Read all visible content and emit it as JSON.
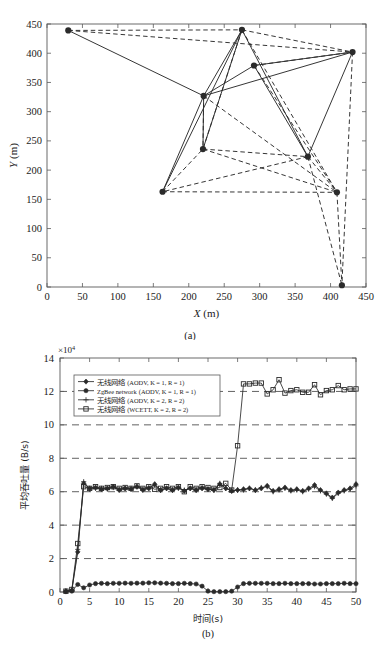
{
  "figure": {
    "panels": [
      {
        "id": "a",
        "caption": "(a)",
        "xlabel_var": "X",
        "xlabel_unit": "(m)",
        "ylabel_var": "Y",
        "ylabel_unit": "(m)"
      },
      {
        "id": "b",
        "caption": "(b)",
        "xlabel": "时间(s)",
        "ylabel": "平均吞吐量 (B/s)",
        "exponent_prefix": "×10",
        "exponent_power": "4"
      }
    ]
  },
  "chart_data": [
    {
      "type": "scatter",
      "title": "",
      "xlabel": "X (m)",
      "ylabel": "Y (m)",
      "xlim": [
        0,
        450
      ],
      "ylim": [
        0,
        450
      ],
      "xticks": [
        0,
        50,
        100,
        150,
        200,
        250,
        300,
        350,
        400,
        450
      ],
      "yticks": [
        0,
        50,
        100,
        150,
        200,
        250,
        300,
        350,
        400,
        450
      ],
      "grid": false,
      "legend": "none",
      "annotations": [
        "Wireless mesh network node topology; solid lines = selected routing links, dashed lines = candidate links"
      ],
      "nodes": [
        {
          "id": 0,
          "x": 30,
          "y": 439
        },
        {
          "id": 1,
          "x": 275,
          "y": 440
        },
        {
          "id": 2,
          "x": 292,
          "y": 379
        },
        {
          "id": 3,
          "x": 431,
          "y": 402
        },
        {
          "id": 4,
          "x": 221,
          "y": 327
        },
        {
          "id": 5,
          "x": 220,
          "y": 236
        },
        {
          "id": 6,
          "x": 368,
          "y": 223
        },
        {
          "id": 7,
          "x": 163,
          "y": 163
        },
        {
          "id": 8,
          "x": 409,
          "y": 162
        },
        {
          "id": 9,
          "x": 416,
          "y": 3
        }
      ],
      "solid_edges": [
        [
          0,
          4
        ],
        [
          1,
          4
        ],
        [
          1,
          7
        ],
        [
          1,
          6
        ],
        [
          2,
          4
        ],
        [
          2,
          6
        ],
        [
          3,
          4
        ],
        [
          3,
          2
        ],
        [
          3,
          6
        ],
        [
          4,
          7
        ],
        [
          4,
          5
        ],
        [
          5,
          1
        ]
      ],
      "dashed_edges": [
        [
          0,
          1
        ],
        [
          0,
          3
        ],
        [
          1,
          3
        ],
        [
          1,
          5
        ],
        [
          1,
          8
        ],
        [
          2,
          3
        ],
        [
          2,
          8
        ],
        [
          3,
          9
        ],
        [
          4,
          5
        ],
        [
          4,
          8
        ],
        [
          5,
          6
        ],
        [
          5,
          8
        ],
        [
          6,
          7
        ],
        [
          6,
          8
        ],
        [
          6,
          9
        ],
        [
          7,
          5
        ],
        [
          7,
          8
        ],
        [
          8,
          9
        ]
      ]
    },
    {
      "type": "line",
      "title": "",
      "xlabel": "时间(s)",
      "ylabel": "平均吞吐量 (B/s)",
      "y_exponent": 10000,
      "xlim": [
        0,
        50
      ],
      "ylim": [
        0,
        14
      ],
      "xticks": [
        0,
        5,
        10,
        15,
        20,
        25,
        30,
        35,
        40,
        45,
        50
      ],
      "yticks": [
        0,
        2,
        4,
        6,
        8,
        10,
        12,
        14
      ],
      "grid": true,
      "grid_style": "dashed-horizontal",
      "legend_position": "upper-left",
      "x": [
        1,
        2,
        3,
        4,
        5,
        6,
        7,
        8,
        9,
        10,
        11,
        12,
        13,
        14,
        15,
        16,
        17,
        18,
        19,
        20,
        21,
        22,
        23,
        24,
        25,
        26,
        27,
        28,
        29,
        30,
        31,
        32,
        33,
        34,
        35,
        36,
        37,
        38,
        39,
        40,
        41,
        42,
        43,
        44,
        45,
        46,
        47,
        48,
        49,
        50
      ],
      "series": [
        {
          "name": "无线网络 (AODV, K = 1, R = 1)",
          "marker": "diamond",
          "values": [
            0.05,
            0.1,
            2.4,
            6.5,
            6.2,
            6.25,
            6.15,
            6.2,
            6.3,
            6.1,
            6.2,
            6.15,
            6.3,
            6.1,
            6.2,
            6.45,
            6.1,
            6.2,
            6.1,
            6.25,
            6.05,
            6.2,
            6.1,
            6.2,
            6.15,
            6.1,
            6.45,
            6.2,
            6.05,
            6.1,
            6.15,
            6.2,
            6.1,
            6.2,
            6.35,
            6.05,
            6.15,
            6.25,
            6.1,
            6.15,
            6.05,
            6.2,
            6.4,
            6.1,
            5.9,
            5.65,
            5.95,
            6.1,
            6.2,
            6.45
          ]
        },
        {
          "name": "ZgBee network (AODV, K = 1, R = 1)",
          "marker": "circle",
          "values": [
            0.02,
            0.05,
            0.45,
            0.25,
            0.42,
            0.5,
            0.52,
            0.5,
            0.52,
            0.52,
            0.53,
            0.52,
            0.53,
            0.53,
            0.55,
            0.55,
            0.53,
            0.52,
            0.5,
            0.5,
            0.52,
            0.5,
            0.48,
            0.35,
            0.05,
            0.02,
            0.02,
            0.02,
            0.05,
            0.3,
            0.5,
            0.52,
            0.52,
            0.52,
            0.52,
            0.5,
            0.5,
            0.52,
            0.5,
            0.5,
            0.5,
            0.5,
            0.48,
            0.48,
            0.5,
            0.5,
            0.5,
            0.52,
            0.5,
            0.5
          ]
        },
        {
          "name": "无线网络 (AODV, K = 2, R = 2)",
          "marker": "plus",
          "values": [
            0.05,
            0.12,
            2.55,
            6.6,
            6.15,
            6.2,
            6.2,
            6.15,
            6.25,
            6.15,
            6.2,
            6.2,
            6.3,
            6.15,
            6.25,
            6.4,
            6.1,
            6.2,
            6.1,
            6.2,
            6.1,
            6.2,
            6.1,
            6.25,
            6.15,
            6.1,
            6.5,
            6.2,
            6.05,
            6.1,
            6.1,
            6.2,
            6.1,
            6.25,
            6.3,
            6.0,
            6.1,
            6.2,
            6.05,
            6.1,
            6.0,
            6.15,
            6.3,
            6.05,
            5.85,
            5.6,
            5.9,
            6.05,
            6.15,
            6.35
          ]
        },
        {
          "name": "无线网络 (WCETT, K = 2, R = 2)",
          "marker": "square",
          "values": [
            0.05,
            0.15,
            2.9,
            6.3,
            6.2,
            6.3,
            6.2,
            6.25,
            6.3,
            6.2,
            6.25,
            6.2,
            6.35,
            6.2,
            6.3,
            6.15,
            6.2,
            6.3,
            6.2,
            6.3,
            6.0,
            6.3,
            6.2,
            6.3,
            6.25,
            6.2,
            6.25,
            6.5,
            6.1,
            8.75,
            12.45,
            12.45,
            12.5,
            12.5,
            11.85,
            12.1,
            12.7,
            11.9,
            12.05,
            12.1,
            11.95,
            11.95,
            12.4,
            11.8,
            12.05,
            12.1,
            12.35,
            12.1,
            12.15,
            12.15
          ]
        }
      ]
    }
  ],
  "colors": {
    "axis": "#5a5a5a",
    "data": "#2b2b2b",
    "grid": "#3a3a3a",
    "background": "#ffffff"
  }
}
